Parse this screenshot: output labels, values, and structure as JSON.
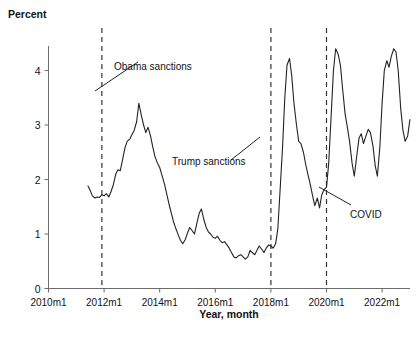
{
  "chart_data": {
    "type": "line",
    "title": "",
    "xlabel": "Year, month",
    "ylabel": "Percent",
    "ylim": [
      0,
      4.45
    ],
    "xlim": [
      2010.0,
      2023.25
    ],
    "grid": false,
    "legend": "none",
    "y_ticks": [
      "0",
      "1",
      "2",
      "3",
      "4"
    ],
    "y_tick_values": [
      0,
      1,
      2,
      3,
      4
    ],
    "x_ticks": [
      "2010m1",
      "2012m1",
      "2014m1",
      "2016m1",
      "2018m1",
      "2020m1",
      "2022m1"
    ],
    "x_tick_values": [
      2010.0,
      2012.0,
      2014.0,
      2016.0,
      2018.0,
      2020.0,
      2022.0
    ],
    "series": [
      {
        "name": "Percent",
        "x": [
          2011.42,
          2011.5,
          2011.58,
          2011.67,
          2011.75,
          2011.83,
          2011.92,
          2012.0,
          2012.08,
          2012.17,
          2012.25,
          2012.33,
          2012.42,
          2012.5,
          2012.58,
          2012.67,
          2012.75,
          2012.83,
          2012.92,
          2013.0,
          2013.08,
          2013.17,
          2013.25,
          2013.33,
          2013.42,
          2013.5,
          2013.58,
          2013.67,
          2013.75,
          2013.83,
          2013.92,
          2014.0,
          2014.08,
          2014.17,
          2014.25,
          2014.33,
          2014.42,
          2014.5,
          2014.58,
          2014.67,
          2014.75,
          2014.83,
          2014.92,
          2015.0,
          2015.08,
          2015.17,
          2015.25,
          2015.33,
          2015.42,
          2015.5,
          2015.58,
          2015.67,
          2015.75,
          2015.83,
          2015.92,
          2016.0,
          2016.08,
          2016.17,
          2016.25,
          2016.33,
          2016.42,
          2016.5,
          2016.58,
          2016.67,
          2016.75,
          2016.83,
          2016.92,
          2017.0,
          2017.08,
          2017.17,
          2017.25,
          2017.33,
          2017.42,
          2017.5,
          2017.58,
          2017.67,
          2017.75,
          2017.83,
          2017.92,
          2018.0,
          2018.08,
          2018.17,
          2018.25,
          2018.33,
          2018.42,
          2018.5,
          2018.58,
          2018.67,
          2018.75,
          2018.83,
          2018.92,
          2019.0,
          2019.08,
          2019.17,
          2019.25,
          2019.33,
          2019.42,
          2019.5,
          2019.58,
          2019.67,
          2019.75,
          2019.83,
          2019.92,
          2020.0,
          2020.08,
          2020.17,
          2020.25,
          2020.33,
          2020.42,
          2020.5,
          2020.58,
          2020.67,
          2020.75,
          2020.83,
          2020.92,
          2021.0,
          2021.08,
          2021.17,
          2021.25,
          2021.33,
          2021.42,
          2021.5,
          2021.58,
          2021.67,
          2021.75,
          2021.83,
          2021.92,
          2022.0,
          2022.08,
          2022.17,
          2022.25,
          2022.33,
          2022.42,
          2022.5,
          2022.58,
          2022.67,
          2022.75,
          2022.83,
          2022.92,
          2023.0
        ],
        "y": [
          1.88,
          1.8,
          1.7,
          1.66,
          1.68,
          1.67,
          1.72,
          1.7,
          1.74,
          1.68,
          1.78,
          1.9,
          2.1,
          2.18,
          2.16,
          2.38,
          2.58,
          2.7,
          2.74,
          2.82,
          2.9,
          3.06,
          3.4,
          3.2,
          3.0,
          2.86,
          2.96,
          2.8,
          2.6,
          2.42,
          2.3,
          2.22,
          2.08,
          1.92,
          1.74,
          1.56,
          1.38,
          1.22,
          1.1,
          0.98,
          0.88,
          0.82,
          0.9,
          1.02,
          1.12,
          1.06,
          1.0,
          1.18,
          1.38,
          1.46,
          1.28,
          1.12,
          1.04,
          1.0,
          0.94,
          0.92,
          0.96,
          0.88,
          0.84,
          0.86,
          0.8,
          0.74,
          0.66,
          0.58,
          0.56,
          0.6,
          0.62,
          0.58,
          0.54,
          0.58,
          0.7,
          0.66,
          0.62,
          0.7,
          0.78,
          0.72,
          0.66,
          0.74,
          0.8,
          0.78,
          0.74,
          0.82,
          1.1,
          1.8,
          2.6,
          3.5,
          4.1,
          4.22,
          3.9,
          3.4,
          3.0,
          2.7,
          2.66,
          2.5,
          2.28,
          2.1,
          1.9,
          1.7,
          1.52,
          1.66,
          1.48,
          1.72,
          1.82,
          1.86,
          2.3,
          3.2,
          4.0,
          4.4,
          4.3,
          4.1,
          3.66,
          3.2,
          2.96,
          2.7,
          2.3,
          2.06,
          2.4,
          2.76,
          2.84,
          2.66,
          2.8,
          2.92,
          2.86,
          2.62,
          2.26,
          2.06,
          2.6,
          3.4,
          4.0,
          4.18,
          4.06,
          4.26,
          4.4,
          4.34,
          4.0,
          3.3,
          2.9,
          2.7,
          2.8,
          3.1
        ]
      }
    ],
    "annotations": [
      {
        "id": "obama-sanctions",
        "label": "Obama sanctions",
        "marker_x": 2011.92,
        "note": "dashed vertical line with leader pointing down-left to the line"
      },
      {
        "id": "trump-sanctions",
        "label": "Trump sanctions",
        "marker_x": 2018.0,
        "note": "dashed vertical line with leader pointing up-right"
      },
      {
        "id": "covid",
        "label": "COVID",
        "marker_x": 2020.0,
        "note": "dashed vertical line with leader pointing up-left"
      }
    ],
    "vertical_markers": [
      {
        "id": "obama-marker",
        "x": 2011.92
      },
      {
        "id": "trump-marker",
        "x": 2018.0
      },
      {
        "id": "covid-marker",
        "x": 2020.0
      }
    ]
  },
  "colors": {
    "series": "#222222",
    "axis": "#6b6b6b",
    "marker": "#333333",
    "background": "#ffffff",
    "text": "#121212"
  }
}
